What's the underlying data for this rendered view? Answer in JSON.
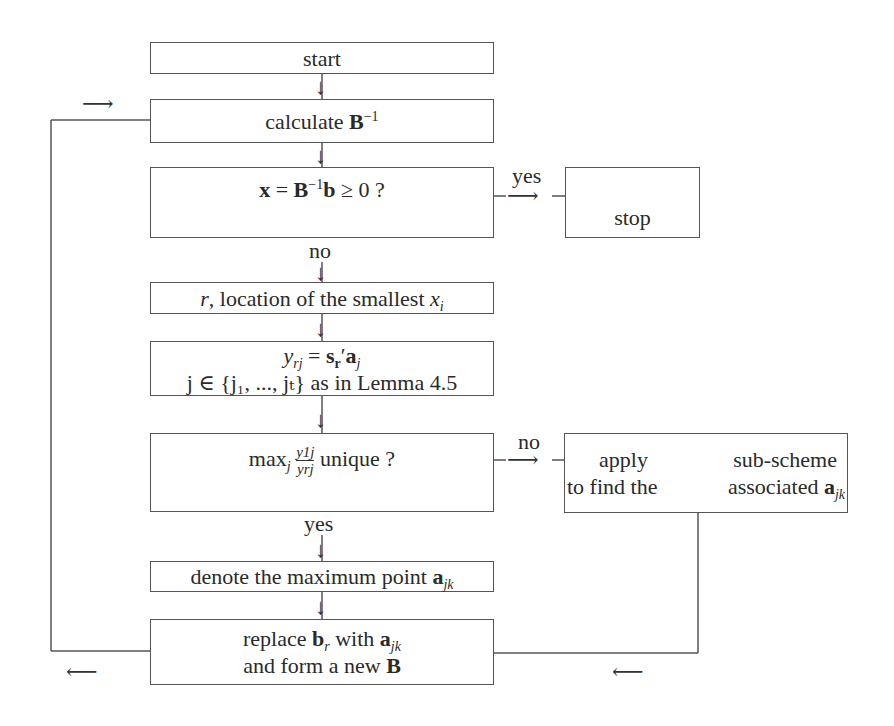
{
  "diagram": {
    "type": "flowchart",
    "nodes": {
      "start": {
        "label": "start"
      },
      "calculate": {
        "prefix": "calculate ",
        "symbol": "B",
        "sup": "−1"
      },
      "check": {
        "x": "x",
        "eq": " = ",
        "B": "B",
        "sup": "−1",
        "b": "b",
        "rest": " ≥ 0 ?"
      },
      "stop": {
        "label": "stop"
      },
      "location": {
        "r": "r",
        "text": ", location of the smallest ",
        "x": "x",
        "sub": "i"
      },
      "yrj": {
        "line1_y": "y",
        "line1_sub": "rj",
        "line1_eq": " = ",
        "line1_s": "s",
        "line1_s_sub": "r",
        "line1_prime": "′",
        "line1_a": "a",
        "line1_a_sub": "j",
        "line2": "j ∈ {j₁, ..., jₜ} as in Lemma 4.5"
      },
      "max": {
        "prefix": "max",
        "sub": "j",
        "num": "y1j",
        "den": "yrj",
        "suffix": " unique ?"
      },
      "apply": {
        "line1_left": "apply",
        "line1_right": "sub-scheme",
        "line2_left": "to find the",
        "line2_right": "associated ",
        "a": "a",
        "a_sub": "jk"
      },
      "denote": {
        "prefix": "denote the maximum point ",
        "a": "a",
        "a_sub": "jk"
      },
      "replace": {
        "line1_prefix": "replace ",
        "b": "b",
        "b_sub": "r",
        "line1_mid": " with ",
        "a": "a",
        "a_sub": "jk",
        "line2_prefix": "and form a new ",
        "B": "B"
      }
    },
    "edge_labels": {
      "yes_right": "yes",
      "no_down": "no",
      "no_right": "no",
      "yes_down": "yes"
    },
    "arrows": {
      "down": "↓",
      "right": "⟶",
      "left": "⟵"
    }
  }
}
